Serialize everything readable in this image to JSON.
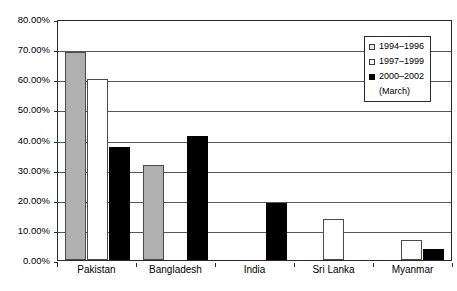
{
  "chart_data": {
    "type": "bar",
    "title": "",
    "subtitle": "",
    "xlabel": "",
    "ylabel": "",
    "categories": [
      "Pakistan",
      "Bangladesh",
      "India",
      "Sri Lanka",
      "Myanmar"
    ],
    "series": [
      {
        "name": "1994–1996",
        "swatch": "s0",
        "color": "#b0b0b0",
        "values": [
          69.0,
          31.5,
          null,
          null,
          null
        ]
      },
      {
        "name": "1997–1999",
        "swatch": "s1",
        "color": "#ffffff",
        "values": [
          60.0,
          null,
          null,
          13.5,
          6.5
        ]
      },
      {
        "name": "2000–2002 (March)",
        "swatch": "s2",
        "color": "#000000",
        "values": [
          37.5,
          41.0,
          19.0,
          null,
          3.5
        ]
      }
    ],
    "ylim": [
      0,
      80
    ],
    "ytick_step": 10,
    "ytick_labels": [
      "80.00%",
      "70.00%",
      "60.00%",
      "50.00%",
      "40.00%",
      "30.00%",
      "20.00%",
      "10.00%",
      "0.00%"
    ],
    "ytick_values": [
      80,
      70,
      60,
      50,
      40,
      30,
      20,
      10,
      0
    ],
    "grid": true,
    "legend_position": "top-right"
  },
  "legend": {
    "entries": [
      {
        "label": "1994–1996",
        "sub": ""
      },
      {
        "label": "1997–1999",
        "sub": ""
      },
      {
        "label": "2000–2002",
        "sub": "(March)"
      }
    ]
  }
}
